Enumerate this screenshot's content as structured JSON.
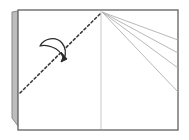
{
  "figure": {
    "kind": "origami-fold-diagram",
    "canvas": {
      "width": 189,
      "height": 140,
      "background": "#ffffff"
    },
    "colors": {
      "paper_fill": "#ffffff",
      "paper_outline": "#6b6b6b",
      "back_flap_fill": "#bdbdbd",
      "back_flap_outline": "#8a8a8a",
      "center_fold_line": "#c9c9c9",
      "radiating_lines": "#b0b0b0",
      "crease_dashed": "#3a3a3a",
      "arrow_stroke": "#2b2b2b",
      "arrow_fill": "#ffffff"
    },
    "labels": {
      "paper_sheet": "paper sheet",
      "back_flap": "back flap behind sheet",
      "center_fold": "vertical center fold",
      "crease": "valley fold crease line",
      "arrow": "fold-over direction arrow",
      "rays": "radiating reference creases"
    },
    "shapes": {
      "back_flap": {
        "name": "back-flap",
        "points": "12,12 18,11 18,126 12,118"
      },
      "sheet": {
        "name": "paper-sheet",
        "x": 18,
        "y": 10,
        "width": 160,
        "height": 120,
        "stroke_width": 1.4
      },
      "center_fold": {
        "name": "center-fold-line",
        "x1": 101,
        "y1": 11,
        "x2": 101,
        "y2": 129,
        "stroke_width": 1.0
      },
      "apex": {
        "x": 102,
        "y": 12
      },
      "rays": [
        {
          "name": "ray-1",
          "x1": 102,
          "y1": 12,
          "x2": 178,
          "y2": 40,
          "stroke_width": 0.9
        },
        {
          "name": "ray-2",
          "x1": 102,
          "y1": 12,
          "x2": 178,
          "y2": 53,
          "stroke_width": 0.9
        },
        {
          "name": "ray-3",
          "x1": 102,
          "y1": 12,
          "x2": 178,
          "y2": 68,
          "stroke_width": 0.9
        },
        {
          "name": "ray-4",
          "x1": 102,
          "y1": 12,
          "x2": 178,
          "y2": 92,
          "stroke_width": 0.9
        }
      ],
      "crease_dashed": {
        "name": "crease-dashed-line",
        "x1": 20,
        "y1": 93,
        "x2": 101,
        "y2": 13,
        "stroke_width": 1.6,
        "dash": "2.4 2.6"
      },
      "arrow": {
        "name": "fold-arrow",
        "outline_path": "M 40 46 C 44 38, 56 36, 62 43 C 66 48, 66 54, 64 59 C 62 54, 58 49, 52 47 C 47 45, 43 45, 40 46 Z",
        "tip_path": "M 61 52 L 67 59 L 61 62 L 63 57 Z",
        "stroke_width": 1.3
      }
    }
  }
}
